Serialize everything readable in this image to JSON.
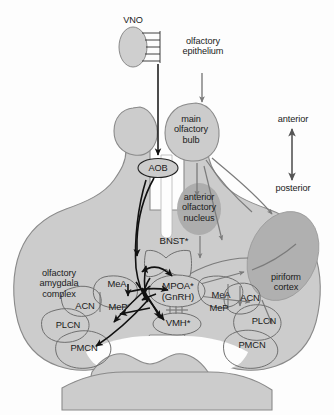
{
  "figure": {
    "type": "neuroanatomical-circuit-diagram",
    "background_color": "#fdfdfd",
    "brain_fill": "#cccccc",
    "brain_outline": "#8a8a8a",
    "dark_region_fill": "#a8a8a8",
    "black_pathway_color": "#111111",
    "gray_pathway_color": "#7b7b7b"
  },
  "inputs": {
    "vno_label": "VNO",
    "olfactory_epithelium_label": "olfactory\nepithelium"
  },
  "bulbs": {
    "aob_label": "AOB",
    "main_olfactory_bulb_label": "main\nolfactory\nbulb",
    "anterior_olfactory_nucleus_label": "anterior\nolfactory\nnucleus"
  },
  "axis": {
    "anterior_label": "anterior",
    "posterior_label": "posterior"
  },
  "regions": {
    "olfactory_amygdala_complex_label": "olfactory\namygdala\ncomplex",
    "piriform_cortex_label": "piriform\ncortex",
    "bnst_label": "BNST*",
    "mpoa_label": "MPOA*",
    "gnrh_label": "(GnRH)",
    "vmh_label": "VMH*"
  },
  "nuclei_left": {
    "mea": "MeA",
    "mep": "MeP",
    "acn": "ACN",
    "plcn": "PLCN",
    "pmcn": "PMCN"
  },
  "nuclei_right": {
    "mea": "MeA",
    "mep": "MeP",
    "acn": "ACN",
    "plcn": "PLCN",
    "pmcn": "PMCN"
  }
}
